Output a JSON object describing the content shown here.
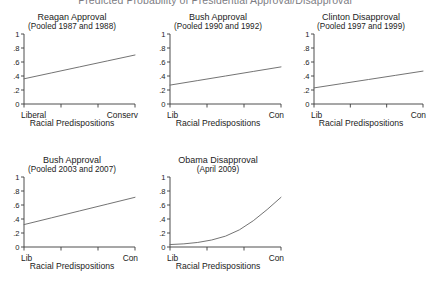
{
  "figure": {
    "title": "Predicted Probability of Presidential Approval/Disapproval",
    "background": "#ffffff",
    "line_color": "#6b6b6b",
    "axis_color": "#3a3a3a"
  },
  "axes": {
    "ytick_labels": [
      "1",
      ".8",
      ".6",
      ".4",
      ".2",
      "0"
    ],
    "ytick_values": [
      1,
      0.8,
      0.6,
      0.4,
      0.2,
      0
    ],
    "ylim": [
      0,
      1
    ],
    "xlim": [
      0,
      1
    ],
    "xtick_count": 4,
    "xaxis_title": "Racial Predispositions"
  },
  "chart_data": [
    {
      "type": "line",
      "title": "Reagan Approval",
      "subtitle": "(Pooled 1987 and 1988)",
      "xlabel": "Racial Predispositions",
      "ylabel": "",
      "xlim": [
        0,
        1
      ],
      "ylim": [
        0,
        1
      ],
      "grid": false,
      "legend": "none",
      "xtick_labels": [
        "Liberal",
        "Conserv"
      ],
      "ytick_labels": [
        "0",
        ".2",
        ".4",
        ".6",
        ".8",
        "1"
      ],
      "x": [
        0,
        0.25,
        0.5,
        0.75,
        1
      ],
      "values": [
        0.36,
        0.445,
        0.53,
        0.615,
        0.7
      ]
    },
    {
      "type": "line",
      "title": "Bush Approval",
      "subtitle": "(Pooled 1990 and 1992)",
      "xlabel": "Racial Predispositions",
      "ylabel": "",
      "xlim": [
        0,
        1
      ],
      "ylim": [
        0,
        1
      ],
      "grid": false,
      "legend": "none",
      "xtick_labels": [
        "Lib",
        "Con"
      ],
      "ytick_labels": [
        "0",
        ".2",
        ".4",
        ".6",
        ".8",
        "1"
      ],
      "x": [
        0,
        0.25,
        0.5,
        0.75,
        1
      ],
      "values": [
        0.27,
        0.335,
        0.4,
        0.465,
        0.53
      ]
    },
    {
      "type": "line",
      "title": "Clinton Disapproval",
      "subtitle": "(Pooled 1997 and 1999)",
      "xlabel": "Racial Predispositions",
      "ylabel": "",
      "xlim": [
        0,
        1
      ],
      "ylim": [
        0,
        1
      ],
      "grid": false,
      "legend": "none",
      "xtick_labels": [
        "Lib",
        "Con"
      ],
      "ytick_labels": [
        "0",
        ".2",
        ".4",
        ".6",
        ".8",
        "1"
      ],
      "x": [
        0,
        0.25,
        0.5,
        0.75,
        1
      ],
      "values": [
        0.23,
        0.29,
        0.35,
        0.41,
        0.47
      ]
    },
    {
      "type": "line",
      "title": "Bush Approval",
      "subtitle": "(Pooled 2003 and 2007)",
      "xlabel": "Racial Predispositions",
      "ylabel": "",
      "xlim": [
        0,
        1
      ],
      "ylim": [
        0,
        1
      ],
      "grid": false,
      "legend": "none",
      "xtick_labels": [
        "Lib",
        "Con"
      ],
      "ytick_labels": [
        "0",
        ".2",
        ".4",
        ".6",
        ".8",
        "1"
      ],
      "x": [
        0,
        0.25,
        0.5,
        0.75,
        1
      ],
      "values": [
        0.32,
        0.4175,
        0.515,
        0.6125,
        0.71
      ]
    },
    {
      "type": "line",
      "title": "Obama Disapproval",
      "subtitle": "(April 2009)",
      "xlabel": "Racial Predispositions",
      "ylabel": "",
      "xlim": [
        0,
        1
      ],
      "ylim": [
        0,
        1
      ],
      "grid": false,
      "legend": "none",
      "xtick_labels": [
        "Lib",
        "Con"
      ],
      "ytick_labels": [
        "0",
        ".2",
        ".4",
        ".6",
        ".8",
        "1"
      ],
      "x": [
        0,
        0.125,
        0.25,
        0.375,
        0.5,
        0.625,
        0.75,
        0.875,
        1
      ],
      "values": [
        0.035,
        0.045,
        0.065,
        0.1,
        0.155,
        0.245,
        0.375,
        0.535,
        0.71
      ]
    }
  ]
}
